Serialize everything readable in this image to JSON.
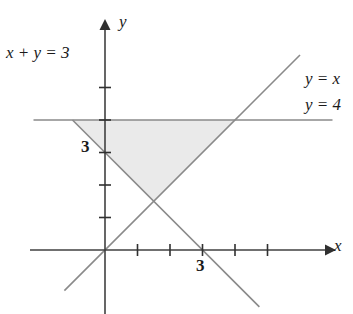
{
  "figure": {
    "kind": "coordinate-plane-linear-inequality-region",
    "background_color": "#ffffff",
    "line_color": "#8a8a8a",
    "axis_color": "#404040",
    "shade_color": "#eaeaea",
    "text_color": "#1a1a1a"
  },
  "axes": {
    "x_axis_label": "x",
    "y_axis_label": "y",
    "origin_px": [
      105,
      250
    ],
    "unit_px": 32.5,
    "x_range": [
      -2.2,
      7.0
    ],
    "y_range": [
      -2.0,
      7.2
    ],
    "x_ticks": [
      1,
      2,
      3,
      4,
      5
    ],
    "y_ticks": [
      1,
      2,
      3,
      4,
      5
    ],
    "x_tick_labels": [
      {
        "value": 3,
        "text": "3"
      }
    ],
    "y_tick_labels": [
      {
        "value": 3,
        "text": "3"
      }
    ],
    "grid": false,
    "arrowheads": [
      "x-positive",
      "y-positive"
    ]
  },
  "lines": [
    {
      "name": "line-y-equals-4",
      "label": "y = 4",
      "equation": "y = 4",
      "slope": 0,
      "intercept": 4,
      "style": "solid",
      "x_from": -2.2,
      "x_to": 7.0
    },
    {
      "name": "line-y-equals-x",
      "label": "y = x",
      "equation": "y = x",
      "slope": 1,
      "intercept": 0,
      "style": "solid",
      "x_from": -1.25,
      "x_to": 6.0
    },
    {
      "name": "line-x-plus-y-equals-3",
      "label": "x + y = 3",
      "equation": "x + y = 3",
      "slope": -1,
      "intercept": 3,
      "style": "solid",
      "x_from": -1.0,
      "x_to": 4.75
    }
  ],
  "shaded_region": {
    "name": "solution-region",
    "description": "Triangle bounded above by y = 4, on the right by y = x, on the left by x + y = 3",
    "vertices": [
      {
        "x": -1.0,
        "y": 4.0
      },
      {
        "x": 4.0,
        "y": 4.0
      },
      {
        "x": 1.5,
        "y": 1.5
      }
    ],
    "fill": "#eaeaea"
  },
  "labels": {
    "x_plus_y": "x + y = 3",
    "y_equals_x": "y = x",
    "y_equals_4": "y = 4",
    "axis_x": "x",
    "axis_y": "y",
    "tick_y_3": "3",
    "tick_x_3": "3"
  }
}
